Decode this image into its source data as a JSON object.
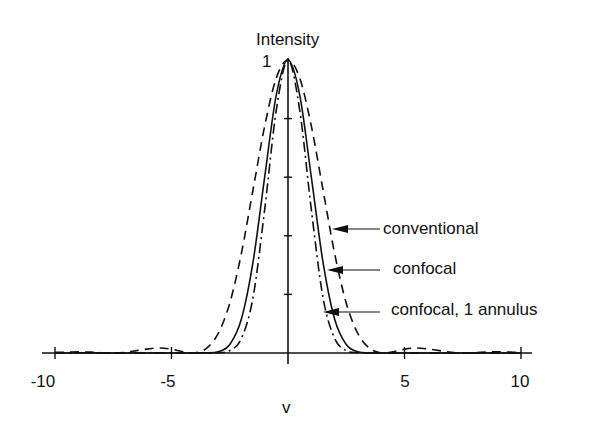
{
  "chart_data": {
    "type": "line",
    "title": "",
    "xlabel": "v",
    "ylabel": "Intensity",
    "xlim": [
      -10,
      10
    ],
    "ylim": [
      0,
      1
    ],
    "grid": false,
    "x_ticks": [
      -10,
      -5,
      5,
      10
    ],
    "x_tick_labels": [
      "-10",
      "-5",
      "5",
      "10"
    ],
    "y_tick_labels": [
      "1"
    ],
    "legend_position": "right, arrow annotations",
    "x": [
      -10,
      -9.5,
      -9,
      -8.5,
      -8,
      -7.5,
      -7,
      -6.5,
      -6,
      -5.5,
      -5,
      -4.5,
      -4,
      -3.5,
      -3,
      -2.5,
      -2,
      -1.5,
      -1,
      -0.5,
      0,
      0.5,
      1,
      1.5,
      2,
      2.5,
      3,
      3.5,
      4,
      4.5,
      5,
      5.5,
      6,
      6.5,
      7,
      7.5,
      8,
      8.5,
      9,
      9.5,
      10
    ],
    "series": [
      {
        "name": "conventional",
        "style": "dashed",
        "values": [
          0.002,
          0.003,
          0.004,
          0.003,
          0.001,
          0.0001,
          0.002,
          0.008,
          0.014,
          0.017,
          0.013,
          0.004,
          0.0002,
          0.016,
          0.066,
          0.17,
          0.34,
          0.558,
          0.775,
          0.939,
          1,
          0.939,
          0.775,
          0.558,
          0.34,
          0.17,
          0.066,
          0.016,
          0.0002,
          0.004,
          0.013,
          0.017,
          0.014,
          0.008,
          0.002,
          0.0001,
          0.001,
          0.003,
          0.004,
          0.003,
          0.002
        ]
      },
      {
        "name": "confocal",
        "style": "solid",
        "values": [
          0,
          0,
          0,
          0,
          0,
          0,
          0,
          0,
          0.0002,
          0.0003,
          0.0002,
          0,
          0,
          0.0003,
          0.004,
          0.029,
          0.116,
          0.311,
          0.601,
          0.882,
          1,
          0.882,
          0.601,
          0.311,
          0.116,
          0.029,
          0.004,
          0.0003,
          0,
          0,
          0.0002,
          0.0003,
          0.0002,
          0,
          0,
          0,
          0,
          0,
          0,
          0,
          0
        ]
      },
      {
        "name": "confocal, 1 annulus",
        "style": "dashdot",
        "values": [
          0,
          0,
          0,
          0,
          0,
          0,
          0,
          0,
          0,
          0,
          0,
          0,
          0,
          0,
          0.001,
          0.008,
          0.05,
          0.19,
          0.49,
          0.83,
          1,
          0.83,
          0.49,
          0.19,
          0.05,
          0.008,
          0.001,
          0,
          0,
          0,
          0,
          0,
          0,
          0,
          0,
          0,
          0,
          0,
          0,
          0,
          0
        ]
      }
    ],
    "annotations": [
      "conventional",
      "confocal",
      "confocal, 1 annulus"
    ]
  },
  "labels": {
    "ylabel": "Intensity",
    "ytick_one": "1",
    "xlabel": "v",
    "legend_conventional": "conventional",
    "legend_confocal": "confocal",
    "legend_annulus": "confocal, 1 annulus"
  }
}
